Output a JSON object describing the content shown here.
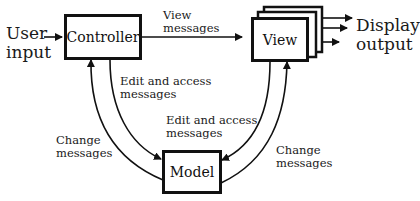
{
  "diagram": {
    "title": "",
    "nodes": {
      "controller": {
        "label": "Controller"
      },
      "view": {
        "label": "View"
      },
      "model": {
        "label": "Model"
      }
    },
    "external": {
      "user_input": {
        "line1": "User",
        "line2": "input"
      },
      "display_output": {
        "line1": "Display",
        "line2": "output"
      }
    },
    "edges": {
      "controller_to_view": {
        "line1": "View",
        "line2": "messages"
      },
      "controller_to_model": {
        "line1": "Edit and access",
        "line2": "messages"
      },
      "view_to_model": {
        "line1": "Edit and access",
        "line2": "messages"
      },
      "model_to_controller": {
        "line1": "Change",
        "line2": "messages"
      },
      "model_to_view": {
        "line1": "Change",
        "line2": "messages"
      }
    },
    "colors": {
      "stroke": "#111111",
      "background": "#ffffff"
    }
  }
}
